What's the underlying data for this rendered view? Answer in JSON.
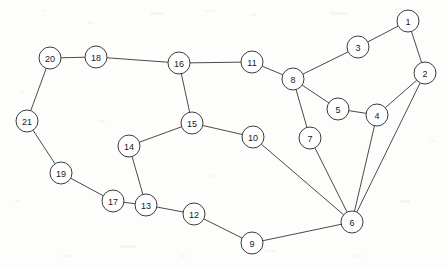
{
  "figure": {
    "type": "node-link-graph",
    "background_color": "#fdfdfc",
    "node_fill_color": "#ffffff",
    "node_stroke_color": "#3c3c3c",
    "edge_color": "#4a4a4a",
    "label_color": "#1a1a1a",
    "node_radius": 11,
    "width": 447,
    "height": 268
  },
  "chart_data": {
    "type": "graph",
    "title": "",
    "xlabel": "",
    "ylabel": "",
    "directed": false,
    "weighted": false,
    "node_count": 21,
    "edge_count": 26,
    "nodes": [
      {
        "id": "1",
        "label": "1",
        "x": 408,
        "y": 21
      },
      {
        "id": "2",
        "label": "2",
        "x": 425,
        "y": 73
      },
      {
        "id": "3",
        "label": "3",
        "x": 358,
        "y": 47
      },
      {
        "id": "4",
        "label": "4",
        "x": 377,
        "y": 115
      },
      {
        "id": "5",
        "label": "5",
        "x": 338,
        "y": 109
      },
      {
        "id": "6",
        "label": "6",
        "x": 352,
        "y": 222
      },
      {
        "id": "7",
        "label": "7",
        "x": 310,
        "y": 138
      },
      {
        "id": "8",
        "label": "8",
        "x": 293,
        "y": 79
      },
      {
        "id": "9",
        "label": "9",
        "x": 252,
        "y": 243
      },
      {
        "id": "10",
        "label": "10",
        "x": 253,
        "y": 137
      },
      {
        "id": "11",
        "label": "11",
        "x": 252,
        "y": 62
      },
      {
        "id": "12",
        "label": "12",
        "x": 194,
        "y": 214
      },
      {
        "id": "13",
        "label": "13",
        "x": 146,
        "y": 205
      },
      {
        "id": "14",
        "label": "14",
        "x": 129,
        "y": 146
      },
      {
        "id": "15",
        "label": "15",
        "x": 192,
        "y": 123
      },
      {
        "id": "16",
        "label": "16",
        "x": 179,
        "y": 63
      },
      {
        "id": "17",
        "label": "17",
        "x": 113,
        "y": 201
      },
      {
        "id": "18",
        "label": "18",
        "x": 96,
        "y": 57
      },
      {
        "id": "19",
        "label": "19",
        "x": 61,
        "y": 173
      },
      {
        "id": "20",
        "label": "20",
        "x": 50,
        "y": 58
      },
      {
        "id": "21",
        "label": "21",
        "x": 27,
        "y": 121
      }
    ],
    "edges": [
      {
        "source": "1",
        "target": "3"
      },
      {
        "source": "1",
        "target": "2"
      },
      {
        "source": "2",
        "target": "4"
      },
      {
        "source": "2",
        "target": "6"
      },
      {
        "source": "3",
        "target": "8"
      },
      {
        "source": "4",
        "target": "5"
      },
      {
        "source": "4",
        "target": "6"
      },
      {
        "source": "5",
        "target": "8"
      },
      {
        "source": "7",
        "target": "8"
      },
      {
        "source": "7",
        "target": "6"
      },
      {
        "source": "8",
        "target": "11"
      },
      {
        "source": "11",
        "target": "16"
      },
      {
        "source": "16",
        "target": "18"
      },
      {
        "source": "16",
        "target": "15"
      },
      {
        "source": "18",
        "target": "20"
      },
      {
        "source": "20",
        "target": "21"
      },
      {
        "source": "21",
        "target": "19"
      },
      {
        "source": "19",
        "target": "17"
      },
      {
        "source": "17",
        "target": "13"
      },
      {
        "source": "13",
        "target": "14"
      },
      {
        "source": "13",
        "target": "12"
      },
      {
        "source": "14",
        "target": "15"
      },
      {
        "source": "15",
        "target": "10"
      },
      {
        "source": "10",
        "target": "6"
      },
      {
        "source": "12",
        "target": "9"
      },
      {
        "source": "9",
        "target": "6"
      }
    ]
  }
}
